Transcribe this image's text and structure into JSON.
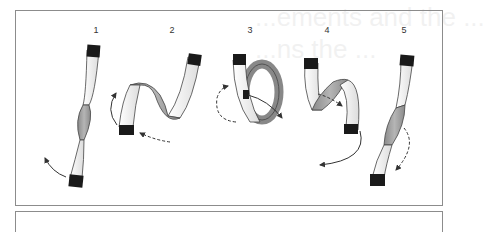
{
  "figure": {
    "type": "step-sequence diagram",
    "steps": [
      {
        "label": "1",
        "description": "Strip with a half twist; bottom end rotated (solid arrow)"
      },
      {
        "label": "2",
        "description": "Strip folded into S-curve; bottom end moved (solid and dashed arrows)"
      },
      {
        "label": "3",
        "description": "Strip looped into a ring; solid arrow through loop, dashed arrow around"
      },
      {
        "label": "4",
        "description": "Strip unfolding; end pulled down and around (solid arrow), dashed arrow across"
      },
      {
        "label": "5",
        "description": "Strip with opposite half twist; dashed arrow at lower end"
      }
    ],
    "ghost_text": [
      "...ements and the ...",
      "...ns the ..."
    ]
  },
  "colors": {
    "border": "#8c8c8c",
    "strip_fill": "#ececec",
    "strip_shadow": "#9a9a9a",
    "end_cap": "#1a1a1a",
    "arrow": "#333333"
  }
}
